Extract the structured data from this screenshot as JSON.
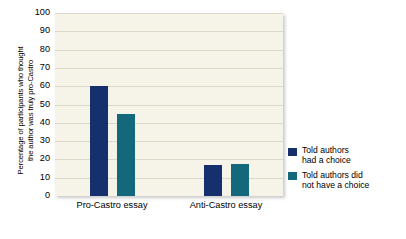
{
  "chart_data": {
    "type": "bar",
    "title": "",
    "xlabel": "",
    "ylabel": "Percentage of participants who thought the author was truly pro-Castro",
    "ylabel_lines": [
      "Percentage of participants who thought",
      "the author was truly pro-Castro"
    ],
    "categories": [
      "Pro-Castro essay",
      "Anti-Castro essay"
    ],
    "series": [
      {
        "name": "Told authors had a choice",
        "name_lines": [
          "Told authors",
          "had a choice"
        ],
        "color": "#16306e",
        "values": [
          60,
          17
        ]
      },
      {
        "name": "Told authors did not have a choice",
        "name_lines": [
          "Told authors did",
          "not have a choice"
        ],
        "color": "#14687c",
        "values": [
          45,
          17.5
        ]
      }
    ],
    "ylim": [
      0,
      100
    ],
    "yticks": [
      0,
      10,
      20,
      30,
      40,
      50,
      60,
      70,
      80,
      90,
      100
    ],
    "ytick_labels": [
      "0",
      "10",
      "20",
      "30",
      "40",
      "50",
      "60",
      "70",
      "80",
      "90",
      "100"
    ],
    "grid": true,
    "legend_position": "right",
    "plot_background": "#f6f3e8",
    "gridline_color": "#ddd9c8",
    "page_background": "#ffffff"
  }
}
